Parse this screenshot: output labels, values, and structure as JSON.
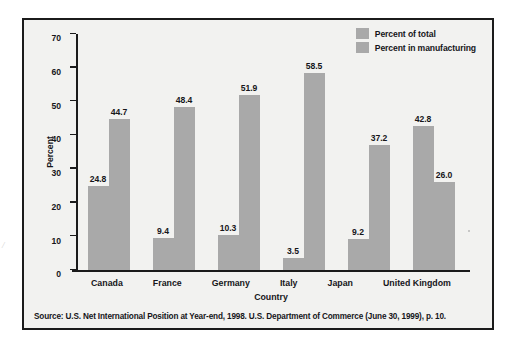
{
  "chart_data": {
    "type": "bar",
    "title": "",
    "xlabel": "Country",
    "ylabel": "Percent",
    "categories": [
      "Canada",
      "France",
      "Germany",
      "Italy",
      "Japan",
      "United Kingdom"
    ],
    "series": [
      {
        "name": "Percent of total",
        "values": [
          24.8,
          9.4,
          10.3,
          3.5,
          9.2,
          42.8
        ],
        "color": "#a9a9a9"
      },
      {
        "name": "Percent in manufacturing",
        "values": [
          44.7,
          48.4,
          51.9,
          58.5,
          37.2,
          26.0
        ],
        "color": "#a9a9a9"
      }
    ],
    "ylim": [
      0,
      70
    ],
    "yticks": [
      0,
      10,
      20,
      30,
      40,
      50,
      60,
      70
    ],
    "ytick_labels": [
      "0",
      "10",
      "20",
      "30",
      "40",
      "50",
      "60",
      "70"
    ],
    "grid": false,
    "legend_position": "top-right",
    "data_labels": true,
    "value_label_format": "one-decimal"
  },
  "legend": {
    "items": [
      {
        "label": "Percent of total",
        "swatch": "legend-swatch-percent-of-total"
      },
      {
        "label": "Percent in manufacturing",
        "swatch": "legend-swatch-percent-in-manufacturing"
      }
    ]
  },
  "source": {
    "text": "Source: U.S. Net International Position at Year-end, 1998. U.S. Department of Commerce (June 30, 1999), p. 10."
  },
  "artifact": {
    "edge_mark": "/"
  },
  "colors": {
    "bar": "#a9a9a9",
    "frame": "#1b1b1b",
    "plot_background": "#f2f2f0",
    "text": "#16161a"
  }
}
